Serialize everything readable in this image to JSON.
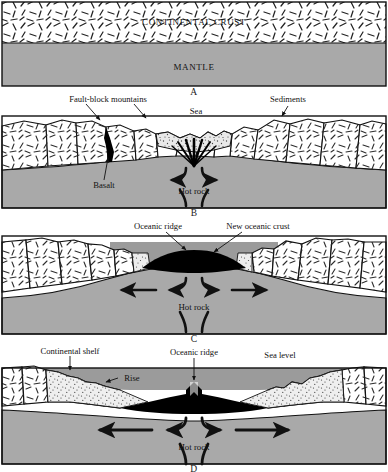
{
  "figure": {
    "panel_count": 4,
    "width": 388,
    "height": 472
  },
  "colors": {
    "mantle_gray": "#a9a9a9",
    "crust_white": "#ffffff",
    "oceanic_crust_black": "#000000",
    "sediment_stipple": "#efefef",
    "water_gray": "#9b9b9b",
    "outline": "#111111",
    "page_background": "#ffffff"
  },
  "panels": [
    {
      "letter": "A",
      "name": "stable-continental-crust",
      "labels": [
        {
          "id": "continental-crust",
          "text": "CONTINENTAL CRUST",
          "style": "smallcaps"
        },
        {
          "id": "mantle",
          "text": "MANTLE",
          "style": "smallcaps"
        }
      ]
    },
    {
      "letter": "B",
      "name": "rifting-fault-block-stage",
      "labels": [
        {
          "id": "fault-block-mountains",
          "text": "Fault-block mountains"
        },
        {
          "id": "sea",
          "text": "Sea"
        },
        {
          "id": "sediments",
          "text": "Sediments"
        },
        {
          "id": "basalt",
          "text": "Basalt"
        },
        {
          "id": "hot-rock",
          "text": "Hot rock"
        }
      ]
    },
    {
      "letter": "C",
      "name": "early-ocean-basin-stage",
      "labels": [
        {
          "id": "oceanic-ridge",
          "text": "Oceanic ridge"
        },
        {
          "id": "new-oceanic-crust",
          "text": "New oceanic crust"
        },
        {
          "id": "hot-rock",
          "text": "Hot rock"
        }
      ]
    },
    {
      "letter": "D",
      "name": "mature-ocean-basin-stage",
      "labels": [
        {
          "id": "continental-shelf",
          "text": "Continental shelf"
        },
        {
          "id": "rise",
          "text": "Rise"
        },
        {
          "id": "oceanic-ridge",
          "text": "Oceanic ridge"
        },
        {
          "id": "sea-level",
          "text": "Sea level"
        },
        {
          "id": "hot-rock",
          "text": "Hot rock"
        }
      ]
    }
  ]
}
